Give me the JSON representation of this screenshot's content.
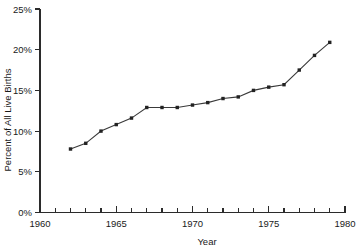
{
  "chart_data": {
    "type": "line",
    "title": "",
    "xlabel": "Year",
    "ylabel": "Percent of All Live Births",
    "xlim": [
      1960,
      1980
    ],
    "ylim": [
      0,
      25
    ],
    "grid": false,
    "legend": null,
    "x_tick_labels": [
      "1960",
      "1965",
      "1970",
      "1975",
      "1980"
    ],
    "x_tick_values": [
      1960,
      1965,
      1970,
      1975,
      1980
    ],
    "x_minor_tick_values": [
      1960,
      1961,
      1962,
      1963,
      1964,
      1965,
      1966,
      1967,
      1968,
      1969,
      1970,
      1971,
      1972,
      1973,
      1974,
      1975,
      1976,
      1977,
      1978,
      1979,
      1980
    ],
    "y_tick_labels": [
      "0%",
      "5%",
      "10%",
      "15%",
      "20%",
      "25%"
    ],
    "y_tick_values": [
      0,
      5,
      10,
      15,
      20,
      25
    ],
    "x": [
      1962,
      1963,
      1964,
      1965,
      1966,
      1967,
      1968,
      1969,
      1970,
      1971,
      1972,
      1973,
      1974,
      1975,
      1976,
      1977,
      1978,
      1979
    ],
    "values": [
      7.8,
      8.5,
      10.0,
      10.8,
      11.6,
      12.9,
      12.9,
      12.9,
      13.2,
      13.5,
      14.0,
      14.2,
      15.0,
      15.4,
      15.7,
      17.5,
      19.3,
      20.9
    ],
    "series": [
      {
        "name": "Percent of All Live Births",
        "x": [
          1962,
          1963,
          1964,
          1965,
          1966,
          1967,
          1968,
          1969,
          1970,
          1971,
          1972,
          1973,
          1974,
          1975,
          1976,
          1977,
          1978,
          1979
        ],
        "values": [
          7.8,
          8.5,
          10.0,
          10.8,
          11.6,
          12.9,
          12.9,
          12.9,
          13.2,
          13.5,
          14.0,
          14.2,
          15.0,
          15.4,
          15.7,
          17.5,
          19.3,
          20.9
        ],
        "color": "#3a3a3a",
        "marker": "square"
      }
    ]
  },
  "axis": {
    "x_title": "Year",
    "y_title": "Percent of All Live Births"
  }
}
